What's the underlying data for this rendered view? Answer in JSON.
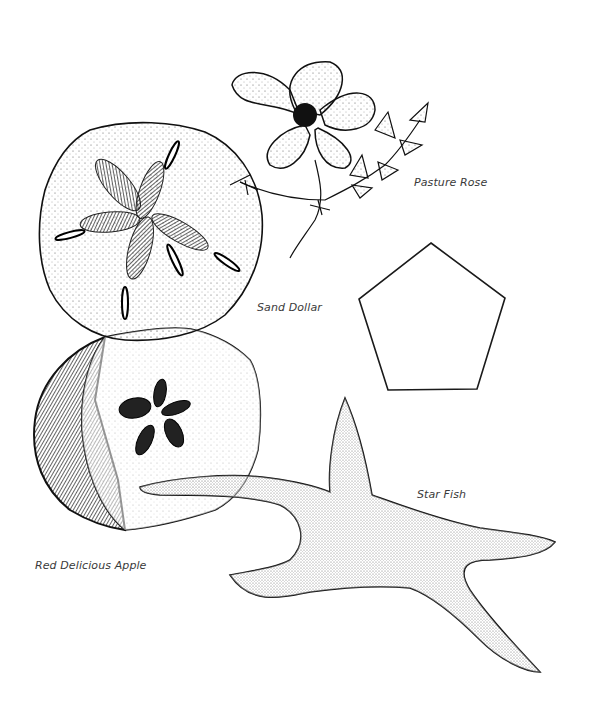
{
  "labels": {
    "pasture_rose": "Pasture Rose",
    "sand_dollar": "Sand Dollar",
    "red_delicious_apple": "Red Delicious Apple",
    "star_fish": "Star Fish"
  },
  "shapes": {
    "pentagon": {
      "points": "431,243 505,298 477,389 388,390 359,299",
      "stroke": "#1a1a1a"
    }
  },
  "colors": {
    "ink": "#111111",
    "background": "#ffffff",
    "label_text": "#3a3a3a"
  }
}
